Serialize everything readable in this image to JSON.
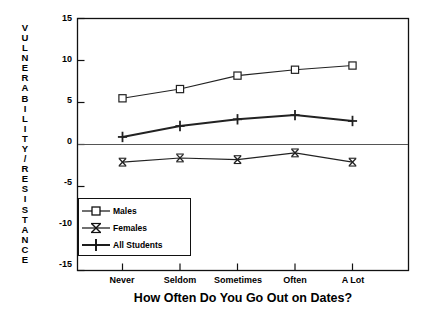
{
  "chart_data": {
    "type": "line",
    "title": "",
    "xlabel": "How Often Do You Go Out on Dates?",
    "ylabel": "VULNERABILITY/RESISTANCE",
    "categories": [
      "Never",
      "Seldom",
      "Sometimes",
      "Often",
      "A Lot"
    ],
    "ylim": [
      -15,
      15
    ],
    "yticks": [
      15,
      10,
      5,
      0,
      -5,
      -10,
      -15
    ],
    "ytick_labels": [
      "15",
      "10",
      "5",
      "0",
      "-5",
      "-10",
      "-15"
    ],
    "grid": false,
    "legend_position": "lower-left-inside",
    "zero_line": true,
    "series": [
      {
        "name": "Males",
        "marker": "square",
        "values": [
          5.5,
          6.6,
          8.2,
          8.9,
          9.4
        ]
      },
      {
        "name": "Females",
        "marker": "x",
        "values": [
          -2.1,
          -1.6,
          -1.8,
          -1.0,
          -2.1
        ]
      },
      {
        "name": "All Students",
        "marker": "plus",
        "values": [
          0.9,
          2.2,
          3.0,
          3.5,
          2.8
        ]
      }
    ],
    "colors": {
      "axis": "#111111",
      "series_line": "#222222",
      "zero_line": "#444444",
      "background": "#ffffff"
    }
  },
  "legend": {
    "items": [
      {
        "label": "Males",
        "marker": "square-marker-icon"
      },
      {
        "label": "Females",
        "marker": "x-marker-icon"
      },
      {
        "label": "All Students",
        "marker": "plus-marker-icon"
      }
    ]
  },
  "ylabel_letters": [
    "V",
    "U",
    "L",
    "N",
    "E",
    "R",
    "A",
    "B",
    "I",
    "L",
    "I",
    "T",
    "Y",
    "/",
    "R",
    "E",
    "S",
    "I",
    "S",
    "T",
    "A",
    "N",
    "C",
    "E"
  ]
}
